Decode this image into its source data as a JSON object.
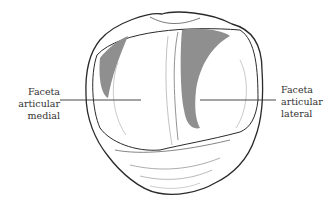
{
  "figure": {
    "colors": {
      "outline": "#2a2a2a",
      "shading": "#8f8f8f",
      "leader_line": "#333333",
      "background": "#ffffff"
    }
  },
  "labels": {
    "medial": {
      "line1": "Faceta",
      "line2": "articular",
      "line3": "medial"
    },
    "lateral": {
      "line1": "Faceta",
      "line2": "articular",
      "line3": "lateral"
    }
  }
}
